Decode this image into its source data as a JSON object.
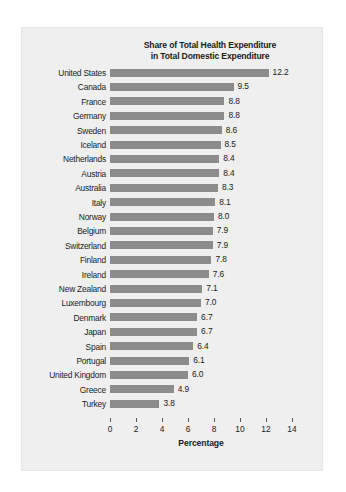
{
  "chart_data": {
    "type": "bar",
    "orientation": "horizontal",
    "title": "Share of Total Health Expenditure in Total Domestic Expenditure",
    "title_lines": [
      "Share of Total Health Expenditure",
      "in Total Domestic Expenditure"
    ],
    "xlabel": "Percentage",
    "ylabel": "",
    "xlim": [
      0,
      14
    ],
    "xticks": [
      0,
      2,
      4,
      6,
      8,
      10,
      12,
      14
    ],
    "xtick_labels": [
      "0",
      "2",
      "4",
      "6",
      "8",
      "10",
      "12",
      "14"
    ],
    "grid": false,
    "legend": false,
    "bar_color": "#8c8c8c",
    "text_color": "#1b1b1b",
    "background_color": "#efefef",
    "categories": [
      "United States",
      "Canada",
      "France",
      "Germany",
      "Sweden",
      "Iceland",
      "Netherlands",
      "Austria",
      "Australia",
      "Italy",
      "Norway",
      "Belgium",
      "Switzerland",
      "Finland",
      "Ireland",
      "New Zealand",
      "Luxembourg",
      "Denmark",
      "Japan",
      "Spain",
      "Portugal",
      "United Kingdom",
      "Greece",
      "Turkey"
    ],
    "values": [
      12.2,
      9.5,
      8.8,
      8.8,
      8.6,
      8.5,
      8.4,
      8.4,
      8.3,
      8.1,
      8.0,
      7.9,
      7.9,
      7.8,
      7.6,
      7.1,
      7.0,
      6.7,
      6.7,
      6.4,
      6.1,
      6.0,
      4.9,
      3.8
    ],
    "value_labels": [
      "12.2",
      "9.5",
      "8.8",
      "8.8",
      "8.6",
      "8.5",
      "8.4",
      "8.4",
      "8.3",
      "8.1",
      "8.0",
      "7.9",
      "7.9",
      "7.8",
      "7.6",
      "7.1",
      "7.0",
      "6.7",
      "6.7",
      "6.4",
      "6.1",
      "6.0",
      "4.9",
      "3.8"
    ]
  }
}
